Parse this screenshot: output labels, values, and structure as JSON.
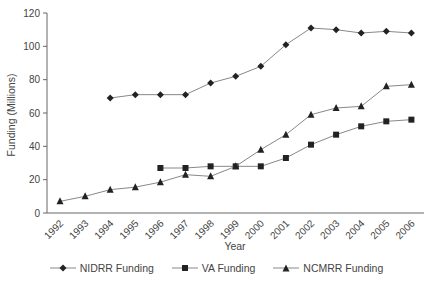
{
  "chart_data": {
    "type": "line",
    "title": "",
    "xlabel": "Year",
    "ylabel": "Funding (Millions)",
    "ylim": [
      0,
      120
    ],
    "yticks": [
      0,
      20,
      40,
      60,
      80,
      100,
      120
    ],
    "grid": false,
    "legend_position": "bottom",
    "x": [
      "1992",
      "1993",
      "1994",
      "1995",
      "1996",
      "1997",
      "1998",
      "1999",
      "2000",
      "2001",
      "2002",
      "2003",
      "2004",
      "2005",
      "2006"
    ],
    "series": [
      {
        "name": "NIDRR Funding",
        "marker": "diamond",
        "values": [
          null,
          null,
          69,
          71,
          71,
          71,
          78,
          82,
          88,
          101,
          111,
          110,
          108,
          109,
          108
        ]
      },
      {
        "name": "VA Funding",
        "marker": "square",
        "values": [
          null,
          null,
          null,
          null,
          27,
          27,
          28,
          28,
          28,
          33,
          41,
          47,
          52,
          55,
          56
        ]
      },
      {
        "name": "NCMRR Funding",
        "marker": "triangle",
        "values": [
          7,
          10,
          14,
          15.5,
          18.5,
          23,
          22,
          28,
          38,
          47,
          59,
          63,
          64,
          76,
          77
        ]
      }
    ]
  },
  "legend": {
    "items": [
      "NIDRR Funding",
      "VA Funding",
      "NCMRR Funding"
    ]
  },
  "colors": {
    "marker": "#222222",
    "line": "#888888",
    "axis": "#666666"
  }
}
